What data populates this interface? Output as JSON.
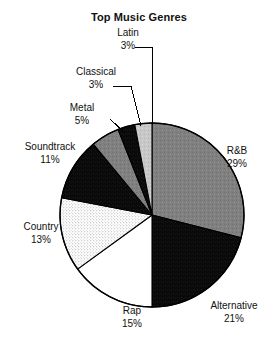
{
  "chart_data": {
    "type": "pie",
    "title": "Top Music Genres",
    "xlabel": "",
    "ylabel": "",
    "legend_position": "none",
    "labels_outside": true,
    "start_angle_deg": 0,
    "direction": "clockwise",
    "units": "percent",
    "categories": [
      "R&B",
      "Alternative",
      "Rap",
      "Country",
      "Soundtrack",
      "Metal",
      "Classical",
      "Latin"
    ],
    "values": [
      29,
      21,
      15,
      13,
      11,
      5,
      3,
      3
    ],
    "slices": [
      {
        "label": "R&B",
        "value": 29,
        "value_text": "29%",
        "fill": "#808080",
        "pattern": "solid-gray",
        "stroke": "#000000"
      },
      {
        "label": "Alternative",
        "value": 21,
        "value_text": "21%",
        "fill": "#0a0a0a",
        "pattern": "solid-black",
        "stroke": "#000000"
      },
      {
        "label": "Rap",
        "value": 15,
        "value_text": "15%",
        "fill": "#ffffff",
        "pattern": "solid-white",
        "stroke": "#000000"
      },
      {
        "label": "Country",
        "value": 13,
        "value_text": "13%",
        "fill": "#f0f0f0",
        "pattern": "stipple",
        "stroke": "#000000"
      },
      {
        "label": "Soundtrack",
        "value": 11,
        "value_text": "11%",
        "fill": "#0a0a0a",
        "pattern": "solid-black",
        "stroke": "#000000"
      },
      {
        "label": "Metal",
        "value": 5,
        "value_text": "5%",
        "fill": "#808080",
        "pattern": "solid-gray",
        "stroke": "#000000"
      },
      {
        "label": "Classical",
        "value": 3,
        "value_text": "3%",
        "fill": "#0a0a0a",
        "pattern": "solid-black",
        "stroke": "#000000"
      },
      {
        "label": "Latin",
        "value": 3,
        "value_text": "3%",
        "fill": "#c8c8c8",
        "pattern": "solid-lightgray",
        "stroke": "#000000"
      }
    ]
  },
  "colors": {
    "background": "#ffffff",
    "text": "#111111",
    "outline": "#000000",
    "gray": "#808080",
    "light_gray": "#c8c8c8",
    "stipple": "#f0f0f0",
    "black": "#0a0a0a"
  }
}
